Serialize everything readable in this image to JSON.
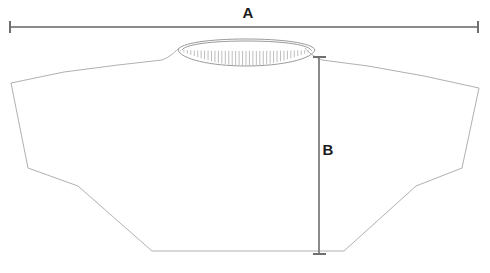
{
  "diagram": {
    "type": "garment-measurement-technical-drawing",
    "background_color": "#ffffff",
    "outline_color": "#b0b0b0",
    "collar_color": "#9a9a9a",
    "rib_color": "#bdbdbd",
    "measure_line_color": "#8a8a8a",
    "measure_cap_color": "#6f6f6f",
    "label_color": "#1a1a1a"
  },
  "measurements": [
    {
      "id": "A",
      "label": "A",
      "orientation": "horizontal",
      "description": "overall width across shoulders and sleeve hems",
      "label_x": 248,
      "label_y": 14,
      "line": {
        "x1": 10,
        "y1": 27,
        "x2": 478,
        "y2": 27
      },
      "caps": [
        {
          "x": 10,
          "y1": 21,
          "y2": 33
        },
        {
          "x": 478,
          "y1": 21,
          "y2": 33
        }
      ]
    },
    {
      "id": "B",
      "label": "B",
      "orientation": "vertical",
      "description": "body length from shoulder seam to bottom hem",
      "label_x": 327,
      "label_y": 150,
      "line": {
        "x1": 319,
        "y1": 57,
        "x2": 319,
        "y2": 254
      },
      "caps": [
        {
          "y": 57,
          "x1": 313,
          "x2": 325
        },
        {
          "y": 254,
          "x1": 313,
          "x2": 325
        }
      ]
    }
  ],
  "garment": {
    "collar": {
      "outer_ellipse": {
        "cx": 246,
        "cy": 50,
        "rx": 69,
        "ry": 9
      },
      "rib_band_depth": 16,
      "rib_tick_count": 40
    },
    "body_path": "M178,47 C175,50 168,56 160,60 L120,66 L70,72 L11,83 L28,168 L75,184 L150,251 L345,251 L418,184 L461,168 L479,88 L410,76 L355,67 L320,60 C312,56 307,52 304,48",
    "hem": {
      "left_x": 150,
      "right_x": 345,
      "y": 251
    }
  }
}
